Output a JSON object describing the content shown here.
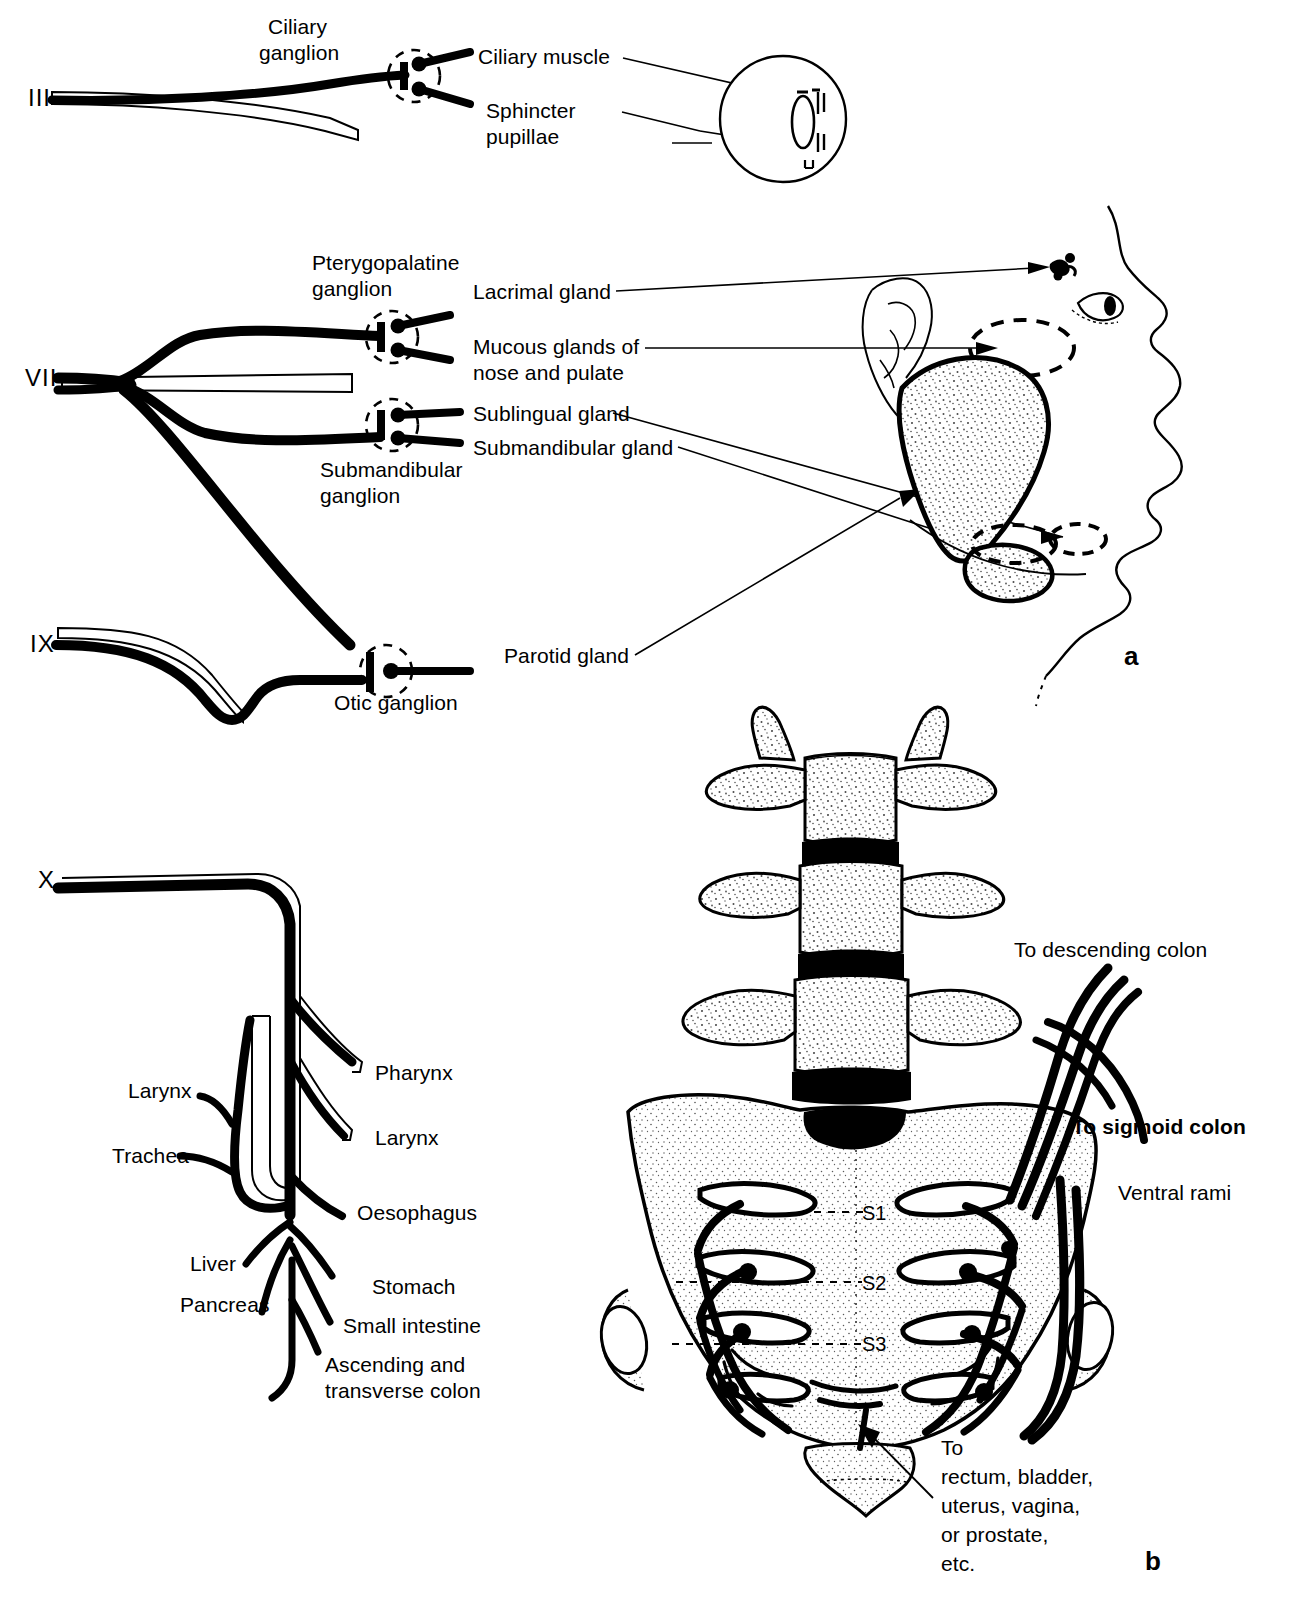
{
  "figure": {
    "panel_a_letter": "a",
    "panel_b_letter": "b"
  },
  "cranial": {
    "nerves": [
      {
        "numeral": "III",
        "name": "oculomotor"
      },
      {
        "numeral": "VII",
        "name": "facial"
      },
      {
        "numeral": "IX",
        "name": "glossopharyngeal"
      },
      {
        "numeral": "X",
        "name": "vagus"
      }
    ],
    "ganglia": [
      {
        "label": "Ciliary\nganglion"
      },
      {
        "label": "Pterygopalatine\nganglion"
      },
      {
        "label": "Submandibular\nganglion"
      },
      {
        "label": "Otic ganglion"
      }
    ],
    "ganglion_ciliary": "Ciliary",
    "ganglion_ciliary_2": "ganglion",
    "ganglion_pterygopalatine": "Pterygopalatine",
    "ganglion_pterygopalatine_2": "ganglion",
    "ganglion_submandibular": "Submandibular",
    "ganglion_submandibular_2": "ganglion",
    "ganglion_otic": "Otic ganglion",
    "targets": {
      "ciliary_muscle": "Ciliary muscle",
      "sphincter_pupillae_1": "Sphincter",
      "sphincter_pupillae_2": "pupillae",
      "lacrimal_gland": "Lacrimal gland",
      "mucous_glands_1": "Mucous glands of",
      "mucous_glands_2": "nose and pulate",
      "sublingual_gland": "Sublingual gland",
      "submandibular_gland": "Submandibular gland",
      "parotid_gland": "Parotid gland"
    }
  },
  "vagus": {
    "numeral": "X",
    "left_labels": {
      "larynx": "Larynx",
      "trachea": "Trachea",
      "liver": "Liver",
      "pancreas": "Pancreas"
    },
    "right_labels": {
      "pharynx": "Pharynx",
      "larynx": "Larynx",
      "oesophagus": "Oesophagus",
      "stomach": "Stomach",
      "small_intestine": "Small intestine",
      "colon_1": "Ascending and",
      "colon_2": "transverse colon"
    }
  },
  "sacral": {
    "segments": [
      "S1",
      "S2",
      "S3"
    ],
    "seg_s1": "S1",
    "seg_s2": "S2",
    "seg_s3": "S3",
    "labels": {
      "descending_colon": "To descending colon",
      "sigmoid_colon": "To sigmoid colon",
      "ventral_rami": "Ventral rami",
      "pelvic_targets_1": "To",
      "pelvic_targets_2": "rectum, bladder,",
      "pelvic_targets_3": "uterus, vagina,",
      "pelvic_targets_4": "or prostate,",
      "pelvic_targets_5": "etc."
    }
  },
  "colors": {
    "ink": "#000000",
    "paper": "#ffffff",
    "stipple": "#bdbdbd"
  }
}
